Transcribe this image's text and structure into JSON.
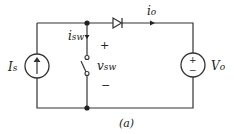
{
  "labels": {
    "source_current": "I",
    "source_current_sub": "s",
    "switch_current": "i",
    "switch_current_sub": "sw",
    "switch_voltage": "v",
    "switch_voltage_sub": "sw",
    "output_current": "i",
    "output_current_sub": "o",
    "output_voltage": "V",
    "output_voltage_sub": "o",
    "plus": "+",
    "minus": "−",
    "caption": "(a)"
  },
  "colors": {
    "wire": "#333333"
  }
}
